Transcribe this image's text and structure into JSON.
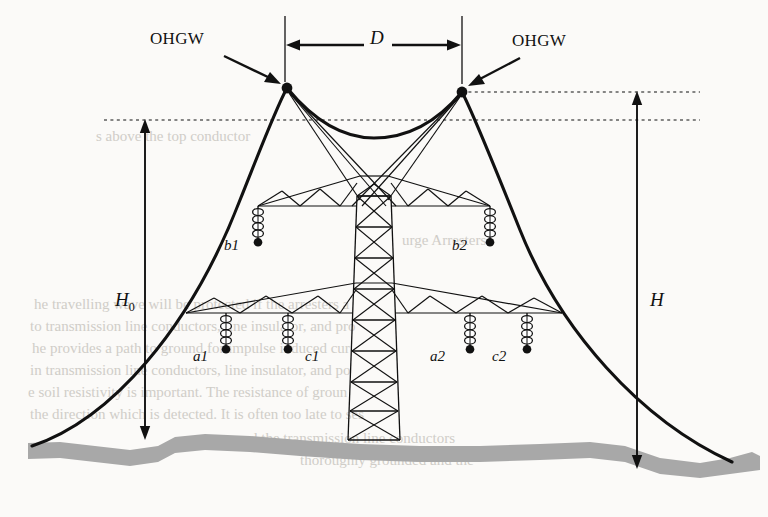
{
  "figure": {
    "type": "engineering-diagram",
    "background_color": "#fbfaf8",
    "ink_color": "#111111",
    "ground_color": "#a8a8a8"
  },
  "labels": {
    "ohgw_left": "OHGW",
    "ohgw_right": "OHGW",
    "span_d": "D",
    "height_h0_main": "H",
    "height_h0_sub": "0",
    "height_h": "H"
  },
  "phases": [
    {
      "id": "b1",
      "label": "b1",
      "level": "upper",
      "side": "left",
      "label_x": 224,
      "label_y": 238,
      "ins_x": 258,
      "ins_y": 206
    },
    {
      "id": "b2",
      "label": "b2",
      "level": "upper",
      "side": "right",
      "label_x": 452,
      "label_y": 238,
      "ins_x": 490,
      "ins_y": 206
    },
    {
      "id": "a1",
      "label": "a1",
      "level": "lower",
      "side": "left",
      "label_x": 193,
      "label_y": 349,
      "ins_x": 226,
      "ins_y": 313
    },
    {
      "id": "c1",
      "label": "c1",
      "level": "lower",
      "side": "left",
      "label_x": 305,
      "label_y": 349,
      "ins_x": 288,
      "ins_y": 313
    },
    {
      "id": "a2",
      "label": "a2",
      "level": "lower",
      "side": "right",
      "label_x": 430,
      "label_y": 349,
      "ins_x": 470,
      "ins_y": 313
    },
    {
      "id": "c2",
      "label": "c2",
      "level": "lower",
      "side": "right",
      "label_x": 492,
      "label_y": 349,
      "ins_x": 527,
      "ins_y": 313
    }
  ],
  "dimensions": {
    "d_span": {
      "left_x": 285,
      "right_x": 462,
      "line_y": 45,
      "label_x": 378,
      "label_y": 36
    },
    "h0": {
      "x": 145,
      "top_y": 120,
      "bottom_y": 437,
      "label_x": 118,
      "label_y": 300
    },
    "h": {
      "x": 637,
      "top_y": 92,
      "bottom_y": 466,
      "label_x": 648,
      "label_y": 300
    }
  },
  "geometry": {
    "ohgw_left_peak": {
      "x": 287,
      "y": 88
    },
    "ohgw_right_peak": {
      "x": 462,
      "y": 92
    },
    "tower_center_x": 374,
    "upper_crossarm_y": 206,
    "lower_crossarm_y": 313
  },
  "bleed_text": [
    {
      "text": "s above the top conductor",
      "x": 96,
      "y": 128,
      "size": 15
    },
    {
      "text": "urge Arresters",
      "x": 402,
      "y": 232,
      "size": 15
    },
    {
      "text": "he travelling wave will be protected if the arresters a",
      "x": 34,
      "y": 296,
      "size": 15
    },
    {
      "text": "to transmission line conductors, line insulator, and pro",
      "x": 30,
      "y": 318,
      "size": 15
    },
    {
      "text": "he provides a path to ground for impulse induced cur",
      "x": 32,
      "y": 340,
      "size": 15
    },
    {
      "text": "in transmission line conductors, line insulator, and po",
      "x": 30,
      "y": 362,
      "size": 15
    },
    {
      "text": "e soil resistivity is important. The resistance of groun",
      "x": 28,
      "y": 384,
      "size": 15
    },
    {
      "text": "the direction which is detected. It is often too late to ses",
      "x": 30,
      "y": 406,
      "size": 15
    },
    {
      "text": "d the transmission line conductors",
      "x": 250,
      "y": 430,
      "size": 15
    },
    {
      "text": "thoroughly grounded and the",
      "x": 300,
      "y": 452,
      "size": 15
    }
  ]
}
